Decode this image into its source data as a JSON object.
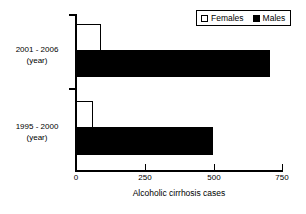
{
  "chart_data": {
    "type": "bar",
    "orientation": "horizontal",
    "title": "",
    "xlabel": "Alcoholic cirrhosis cases",
    "ylabel": "",
    "xlim": [
      0,
      750
    ],
    "xticks": [
      0,
      250,
      500,
      750
    ],
    "xtick_labels": [
      "0",
      "250",
      "500",
      "750"
    ],
    "grid": false,
    "legend_position": "top-right",
    "categories": [
      "2001 - 2006\n(year)",
      "1995 - 2000\n(year)"
    ],
    "category_labels": [
      {
        "line1": "2001 - 2006",
        "line2": "(year)"
      },
      {
        "line1": "1995 - 2000",
        "line2": "(year)"
      }
    ],
    "series": [
      {
        "name": "Females",
        "color": "#ffffff",
        "values": [
          90,
          62
        ]
      },
      {
        "name": "Males",
        "color": "#000000",
        "values": [
          705,
          500
        ]
      }
    ]
  },
  "legend": {
    "items": [
      {
        "label": "Females",
        "swatch": "white-square"
      },
      {
        "label": "Males",
        "swatch": "black-square"
      }
    ]
  },
  "axis": {
    "x_title": "Alcoholic cirrhosis cases",
    "tick_labels": [
      "0",
      "250",
      "500",
      "750"
    ]
  }
}
